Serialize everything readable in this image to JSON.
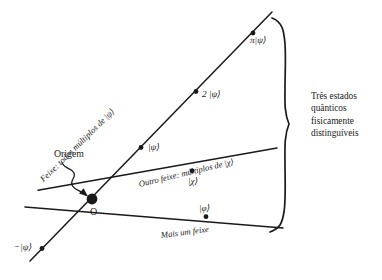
{
  "figure": {
    "background_color": "#ffffff",
    "ink_color": "#1a1a1a"
  },
  "labels": {
    "origin_text": "Origem",
    "origin_point": "O",
    "beam_psi": "Feixe: todos múltiplos de |ψ⟩",
    "beam_chi": "Outro feixe: múltiplos de |χ⟩",
    "beam_phi": "Mais um feixe",
    "point_pi_psi": "π|ψ⟩",
    "point_2_psi": "2 |ψ⟩",
    "point_psi": "|ψ⟩",
    "point_chi": "|χ⟩",
    "point_phi": "|φ⟩",
    "point_neg_psi": "−|ψ⟩",
    "brace_text_line1": "Três estados",
    "brace_text_line2": "quânticos",
    "brace_text_line3": "fisicamente",
    "brace_text_line4": "distinguíveis"
  },
  "geometry": {
    "origin": {
      "x": 92,
      "y": 199
    },
    "rays": [
      {
        "name": "psi-ray",
        "x1": 30,
        "y1": 260,
        "x2": 272,
        "y2": 12
      },
      {
        "name": "chi-ray",
        "x1": 38,
        "y1": 190,
        "x2": 277,
        "y2": 148
      },
      {
        "name": "phi-ray",
        "x1": 25,
        "y1": 207,
        "x2": 283,
        "y2": 228
      }
    ],
    "dots": [
      {
        "name": "dot-neg-psi",
        "x": 42,
        "y": 248
      },
      {
        "name": "dot-psi",
        "x": 141,
        "y": 148
      },
      {
        "name": "dot-2-psi",
        "x": 196,
        "y": 93
      },
      {
        "name": "dot-pi-psi",
        "x": 253,
        "y": 33
      },
      {
        "name": "dot-chi",
        "x": 192,
        "y": 172
      },
      {
        "name": "dot-phi",
        "x": 206,
        "y": 217
      }
    ],
    "brace": {
      "top_y": 18,
      "bottom_y": 232,
      "tip_x": 290,
      "tip_y": 126
    }
  }
}
